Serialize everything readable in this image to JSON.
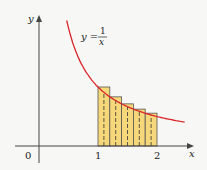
{
  "chart_data": {
    "type": "bar",
    "title": "",
    "function_label": {
      "lhs": "y =",
      "numerator": "1",
      "denominator": "x"
    },
    "xlabel": "x",
    "ylabel": "y",
    "x_ticks": [
      "0",
      "1",
      "2"
    ],
    "curve": {
      "expression": "y = 1/x",
      "x_range": [
        0.47,
        2.47
      ],
      "color": "#d9262b"
    },
    "rectangles": {
      "x_left": [
        1.0,
        1.2,
        1.4,
        1.6,
        1.8
      ],
      "width": 0.2,
      "heights": [
        1.0,
        0.833,
        0.714,
        0.625,
        0.556
      ],
      "fill": "#f6d77a",
      "midpoint_dashed_lines": [
        1.1,
        1.3,
        1.5,
        1.7,
        1.9
      ]
    },
    "categories": [
      "[1,1.2]",
      "[1.2,1.4]",
      "[1.4,1.6]",
      "[1.6,1.8]",
      "[1.8,2]"
    ],
    "values": [
      1.0,
      0.833,
      0.714,
      0.625,
      0.556
    ],
    "xlim": [
      -0.4,
      2.6
    ],
    "grid": false
  }
}
